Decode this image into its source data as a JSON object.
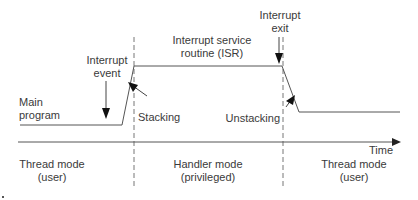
{
  "diagram": {
    "labels": {
      "main_program": [
        "Main",
        "program"
      ],
      "interrupt_event": [
        "Interrupt",
        "event"
      ],
      "isr": [
        "Interrupt service",
        "routine (ISR)"
      ],
      "interrupt_exit": [
        "Interrupt",
        "exit"
      ],
      "stacking": "Stacking",
      "unstacking": "Unstacking",
      "time_axis": "Time"
    },
    "modes": [
      {
        "name": "Thread mode",
        "sub": "(user)"
      },
      {
        "name": "Handler mode",
        "sub": "(privileged)"
      },
      {
        "name": "Thread mode",
        "sub": "(user)"
      }
    ],
    "colors": {
      "line": "#555555",
      "dashed": "#777777",
      "text": "#3a3a3a"
    }
  }
}
